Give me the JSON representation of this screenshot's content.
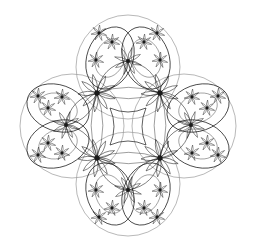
{
  "figure": {
    "width": 254,
    "height": 252,
    "background": "#ffffff",
    "stroke_color": "#1a1a1a",
    "circle_color": "#9a9a9a",
    "outer_circles": [
      {
        "cx": 128,
        "cy": 67,
        "r": 52
      },
      {
        "cx": 72,
        "cy": 126,
        "r": 52
      },
      {
        "cx": 184,
        "cy": 126,
        "r": 52
      },
      {
        "cx": 128,
        "cy": 184,
        "r": 52
      }
    ],
    "main_hubs": [
      {
        "x": 97,
        "y": 93
      },
      {
        "x": 160,
        "y": 93
      },
      {
        "x": 97,
        "y": 158
      },
      {
        "x": 160,
        "y": 158
      }
    ],
    "secondary_hubs": [
      {
        "x": 128,
        "y": 61
      },
      {
        "x": 66,
        "y": 125
      },
      {
        "x": 191,
        "y": 125
      },
      {
        "x": 128,
        "y": 190
      }
    ],
    "lobes": [
      {
        "cx": 110,
        "cy": 58,
        "rx": 23,
        "ry": 32,
        "rot": 20
      },
      {
        "cx": 146,
        "cy": 58,
        "rx": 23,
        "ry": 32,
        "rot": -20
      },
      {
        "cx": 58,
        "cy": 108,
        "rx": 32,
        "ry": 23,
        "rot": 20
      },
      {
        "cx": 58,
        "cy": 144,
        "rx": 32,
        "ry": 23,
        "rot": -20
      },
      {
        "cx": 198,
        "cy": 108,
        "rx": 32,
        "ry": 23,
        "rot": -20
      },
      {
        "cx": 198,
        "cy": 144,
        "rx": 32,
        "ry": 23,
        "rot": 20
      },
      {
        "cx": 110,
        "cy": 194,
        "rx": 23,
        "ry": 32,
        "rot": -20
      },
      {
        "cx": 146,
        "cy": 194,
        "rx": 23,
        "ry": 32,
        "rot": 20
      }
    ],
    "small_hubs": [
      {
        "x": 112,
        "y": 42
      },
      {
        "x": 144,
        "y": 42
      },
      {
        "x": 99,
        "y": 33
      },
      {
        "x": 157,
        "y": 33
      },
      {
        "x": 96,
        "y": 60
      },
      {
        "x": 160,
        "y": 60
      },
      {
        "x": 48,
        "y": 108
      },
      {
        "x": 48,
        "y": 143
      },
      {
        "x": 38,
        "y": 96
      },
      {
        "x": 38,
        "y": 155
      },
      {
        "x": 62,
        "y": 97
      },
      {
        "x": 62,
        "y": 153
      },
      {
        "x": 207,
        "y": 108
      },
      {
        "x": 207,
        "y": 143
      },
      {
        "x": 218,
        "y": 96
      },
      {
        "x": 218,
        "y": 155
      },
      {
        "x": 192,
        "y": 97
      },
      {
        "x": 192,
        "y": 153
      },
      {
        "x": 112,
        "y": 208
      },
      {
        "x": 144,
        "y": 208
      },
      {
        "x": 99,
        "y": 217
      },
      {
        "x": 157,
        "y": 217
      },
      {
        "x": 96,
        "y": 190
      },
      {
        "x": 160,
        "y": 190
      }
    ],
    "center_region": {
      "x1": 110,
      "y1": 108,
      "x2": 146,
      "y2": 145
    }
  }
}
